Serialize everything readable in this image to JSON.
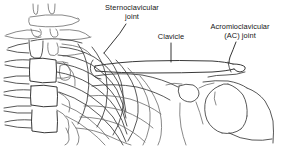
{
  "figure": {
    "kind": "line-drawing",
    "background_color": "#ffffff",
    "ink_color": "#3a3a3a",
    "width": 286,
    "height": 146
  },
  "labels": {
    "sternoclavicular": {
      "line1": "Sternoclavicular",
      "line2": "joint"
    },
    "clavicle": {
      "line1": "Clavicle"
    },
    "ac_joint": {
      "line1": "Acromioclavicular",
      "line2": "(AC) joint"
    }
  }
}
